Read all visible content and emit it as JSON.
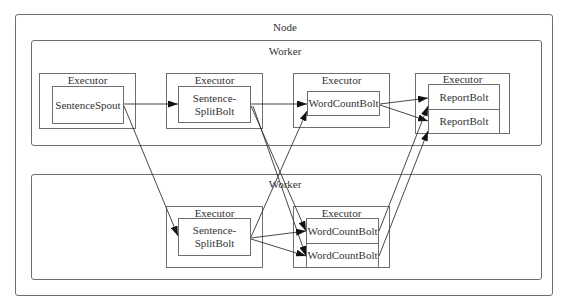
{
  "node": {
    "label": "Node"
  },
  "workers": [
    {
      "label": "Worker"
    },
    {
      "label": "Worker"
    }
  ],
  "executors": [
    {
      "label": "Executor",
      "tasks": [
        "SentenceSpout"
      ]
    },
    {
      "label": "Executor",
      "tasks": [
        "Sentence-\nSplitBolt"
      ]
    },
    {
      "label": "Executor",
      "tasks": [
        "WordCountBolt"
      ]
    },
    {
      "label": "Executor",
      "tasks": [
        "ReportBolt",
        "ReportBolt"
      ]
    },
    {
      "label": "Executor",
      "tasks": [
        "Sentence-\nSplitBolt"
      ]
    },
    {
      "label": "Executor",
      "tasks": [
        "WordCountBolt",
        "WordCountBolt"
      ]
    }
  ],
  "edges": [
    {
      "from": "SentenceSpout",
      "to": "SentenceSplitBolt (worker 1)"
    },
    {
      "from": "SentenceSpout",
      "to": "SentenceSplitBolt (worker 2)"
    },
    {
      "from": "SentenceSplitBolt (worker 1)",
      "to": "WordCountBolt (worker 1)"
    },
    {
      "from": "SentenceSplitBolt (worker 1)",
      "to": "WordCountBolt A (worker 2)"
    },
    {
      "from": "SentenceSplitBolt (worker 1)",
      "to": "WordCountBolt B (worker 2)"
    },
    {
      "from": "SentenceSplitBolt (worker 2)",
      "to": "WordCountBolt (worker 1)"
    },
    {
      "from": "SentenceSplitBolt (worker 2)",
      "to": "WordCountBolt A (worker 2)"
    },
    {
      "from": "SentenceSplitBolt (worker 2)",
      "to": "WordCountBolt B (worker 2)"
    },
    {
      "from": "WordCountBolt (worker 1)",
      "to": "ReportBolt A"
    },
    {
      "from": "WordCountBolt (worker 1)",
      "to": "ReportBolt B"
    },
    {
      "from": "WordCountBolt A (worker 2)",
      "to": "ReportBolt A"
    },
    {
      "from": "WordCountBolt B (worker 2)",
      "to": "ReportBolt B"
    }
  ],
  "colors": {
    "stroke": "#6e6e6e",
    "edge": "#333333",
    "text": "#333333"
  }
}
